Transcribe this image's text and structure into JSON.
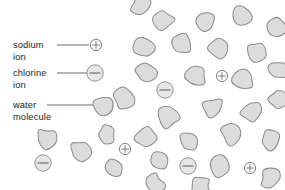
{
  "figure": {
    "name": "salt-dissolved-in-water-diagram",
    "background_color": "#ffffff",
    "width": 285,
    "height": 190
  },
  "legend": {
    "items": [
      {
        "id": "sodium-ion",
        "line1": "sodium",
        "line2": "ion",
        "symbol": "+",
        "symbol_name": "plus-sign",
        "marker": "small-circle-plus",
        "text_x": 13,
        "text_y": 45,
        "leader_x1": 57,
        "leader_x2": 89,
        "leader_y": 45,
        "marker_cx": 96,
        "marker_cy": 45,
        "marker_r": 5.6
      },
      {
        "id": "chlorine-ion",
        "line1": "chlorine",
        "line2": "ion",
        "symbol": "−",
        "symbol_name": "minus-sign",
        "marker": "large-circle-minus",
        "text_x": 13,
        "text_y": 73,
        "leader_x1": 57,
        "leader_x2": 87,
        "leader_y": 73,
        "marker_cx": 95,
        "marker_cy": 73,
        "marker_r": 8.2
      },
      {
        "id": "water-molecule",
        "line1": "water",
        "line2": "molecule",
        "symbol": "",
        "symbol_name": "blob-shape",
        "marker": "water-blob",
        "text_x": 13,
        "text_y": 105,
        "leader_x1": 47,
        "leader_x2": 94,
        "leader_y": 105,
        "marker_cx": 103,
        "marker_cy": 106
      }
    ]
  },
  "scene": {
    "water_molecules": [
      {
        "cx": 163,
        "cy": 20,
        "r": 10.5,
        "seed": 1
      },
      {
        "cx": 206,
        "cy": 22,
        "r": 10.0,
        "seed": 2
      },
      {
        "cx": 243,
        "cy": 16,
        "r": 10.8,
        "seed": 3
      },
      {
        "cx": 277,
        "cy": 28,
        "r": 10.2,
        "seed": 4
      },
      {
        "cx": 144,
        "cy": 48,
        "r": 10.6,
        "seed": 5
      },
      {
        "cx": 183,
        "cy": 45,
        "r": 10.4,
        "seed": 6
      },
      {
        "cx": 219,
        "cy": 47,
        "r": 10.9,
        "seed": 7
      },
      {
        "cx": 257,
        "cy": 52,
        "r": 10.1,
        "seed": 8
      },
      {
        "cx": 103,
        "cy": 106,
        "r": 9.8,
        "seed": 9
      },
      {
        "cx": 146,
        "cy": 72,
        "r": 10.3,
        "seed": 10
      },
      {
        "cx": 196,
        "cy": 76,
        "r": 10.7,
        "seed": 11
      },
      {
        "cx": 243,
        "cy": 80,
        "r": 10.5,
        "seed": 12
      },
      {
        "cx": 279,
        "cy": 70,
        "r": 10.0,
        "seed": 13
      },
      {
        "cx": 124,
        "cy": 98,
        "r": 10.2,
        "seed": 14
      },
      {
        "cx": 168,
        "cy": 118,
        "r": 10.6,
        "seed": 15
      },
      {
        "cx": 213,
        "cy": 108,
        "r": 10.4,
        "seed": 16
      },
      {
        "cx": 252,
        "cy": 112,
        "r": 10.8,
        "seed": 17
      },
      {
        "cx": 279,
        "cy": 100,
        "r": 9.9,
        "seed": 18
      },
      {
        "cx": 146,
        "cy": 138,
        "r": 10.5,
        "seed": 19
      },
      {
        "cx": 190,
        "cy": 142,
        "r": 10.3,
        "seed": 20
      },
      {
        "cx": 232,
        "cy": 134,
        "r": 10.7,
        "seed": 21
      },
      {
        "cx": 270,
        "cy": 140,
        "r": 10.2,
        "seed": 22
      },
      {
        "cx": 46,
        "cy": 139,
        "r": 10.6,
        "seed": 23
      },
      {
        "cx": 80,
        "cy": 152,
        "r": 10.4,
        "seed": 24
      },
      {
        "cx": 106,
        "cy": 135,
        "r": 10.1,
        "seed": 25
      },
      {
        "cx": 113,
        "cy": 167,
        "r": 10.5,
        "seed": 26
      },
      {
        "cx": 158,
        "cy": 160,
        "r": 10.3,
        "seed": 27
      },
      {
        "cx": 218,
        "cy": 165,
        "r": 10.8,
        "seed": 28
      },
      {
        "cx": 154,
        "cy": 184,
        "r": 10.0,
        "seed": 29
      },
      {
        "cx": 200,
        "cy": 186,
        "r": 10.2,
        "seed": 30
      },
      {
        "cx": 271,
        "cy": 178,
        "r": 10.4,
        "seed": 31
      },
      {
        "cx": 141,
        "cy": 6,
        "r": 9.8,
        "seed": 32
      }
    ],
    "ions": [
      {
        "id": "scene-chlorine-1",
        "type": "chlorine",
        "symbol": "−",
        "cx": 165,
        "cy": 90,
        "r": 8.2
      },
      {
        "id": "scene-sodium-1",
        "type": "sodium",
        "symbol": "+",
        "cx": 222,
        "cy": 76,
        "r": 5.6
      },
      {
        "id": "scene-chlorine-2",
        "type": "chlorine",
        "symbol": "−",
        "cx": 43,
        "cy": 163,
        "r": 8.2
      },
      {
        "id": "scene-sodium-2",
        "type": "sodium",
        "symbol": "+",
        "cx": 125,
        "cy": 149,
        "r": 5.6
      },
      {
        "id": "scene-chlorine-3",
        "type": "chlorine",
        "symbol": "−",
        "cx": 188,
        "cy": 166,
        "r": 8.2
      },
      {
        "id": "scene-sodium-3",
        "type": "sodium",
        "symbol": "+",
        "cx": 250,
        "cy": 168,
        "r": 5.6
      }
    ]
  },
  "colors": {
    "blob_fill": "#dcdcdc",
    "blob_stroke": "#8d8d8d",
    "text": "#231f20",
    "leader_line": "#58595b",
    "background": "#ffffff"
  }
}
